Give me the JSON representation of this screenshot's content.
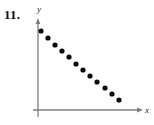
{
  "figure": {
    "problem_number": "11.",
    "axes": {
      "x_label": "x",
      "y_label": "y",
      "color": "#7d7d7d",
      "origin_x": 38,
      "origin_y": 110,
      "y_top": 19,
      "x_right": 143,
      "y_below_origin": 117
    },
    "point_color": "#0a0a0a",
    "point_radius": 2.6
  },
  "chart_data": {
    "type": "scatter",
    "title": "",
    "xlabel": "x",
    "ylabel": "y",
    "grid": false,
    "legend": null,
    "axis_arrows": true,
    "tick_labels": [],
    "xlim": [
      0,
      12
    ],
    "ylim": [
      0,
      12
    ],
    "x": [
      1,
      2,
      3,
      4,
      5,
      6,
      7,
      8,
      9,
      10,
      11,
      12
    ],
    "y": [
      11.0,
      10.1,
      9.3,
      8.5,
      7.7,
      6.9,
      6.1,
      5.3,
      4.5,
      3.7,
      2.9,
      2.1
    ],
    "points_px": [
      {
        "x": 41,
        "y": 31
      },
      {
        "x": 48,
        "y": 38
      },
      {
        "x": 55,
        "y": 45
      },
      {
        "x": 62,
        "y": 51
      },
      {
        "x": 69,
        "y": 57
      },
      {
        "x": 76,
        "y": 64
      },
      {
        "x": 83,
        "y": 70
      },
      {
        "x": 90,
        "y": 76
      },
      {
        "x": 97,
        "y": 82
      },
      {
        "x": 105,
        "y": 88
      },
      {
        "x": 112,
        "y": 94
      },
      {
        "x": 119,
        "y": 100
      }
    ]
  }
}
